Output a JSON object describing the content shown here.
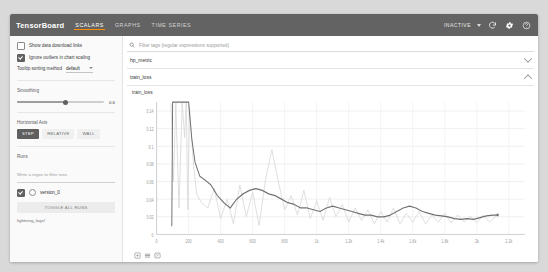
{
  "topbar": {
    "brand": "TensorBoard",
    "tabs": [
      {
        "label": "SCALARS",
        "active": true
      },
      {
        "label": "GRAPHS",
        "active": false
      },
      {
        "label": "TIME SERIES",
        "active": false
      }
    ],
    "status": "INACTIVE",
    "icons": [
      "refresh-icon",
      "settings-icon",
      "help-icon"
    ],
    "bg_color": "#636363",
    "active_tab_underline": "#ff8f00"
  },
  "sidebar": {
    "show_download_links": {
      "label": "Show data download links",
      "checked": false
    },
    "ignore_outliers": {
      "label": "Ignore outliers in chart scaling",
      "checked": true
    },
    "tooltip_sorting": {
      "label": "Tooltip sorting method",
      "value": "default"
    },
    "smoothing": {
      "label": "Smoothing",
      "value": "0.6"
    },
    "horizontal_axis": {
      "label": "Horizontal Axis",
      "options": [
        {
          "label": "STEP",
          "active": true
        },
        {
          "label": "RELATIVE",
          "active": false
        },
        {
          "label": "WALL",
          "active": false
        }
      ]
    },
    "runs": {
      "label": "Runs",
      "filter_placeholder": "Write a regex to filter runs",
      "items": [
        {
          "label": "version_0",
          "checked": true
        }
      ],
      "toggle_all": "TOGGLE ALL RUNS",
      "log_dir": "lightning_logs/"
    }
  },
  "main": {
    "search_placeholder": "Filter tags (regular expressions supported)",
    "sections": [
      {
        "title": "hp_metric",
        "expanded": false
      },
      {
        "title": "train_loss",
        "expanded": true
      }
    ],
    "chart_buttons": [
      "expand-icon",
      "pan-icon",
      "reset-icon"
    ]
  },
  "chart_data": {
    "type": "line",
    "title": "train_loss",
    "xlabel": "",
    "ylabel": "",
    "xlim": [
      0,
      2300
    ],
    "ylim": [
      0,
      0.15
    ],
    "grid": true,
    "legend": null,
    "xticks": [
      0,
      200,
      400,
      600,
      800,
      1000,
      1200,
      1400,
      1600,
      1800,
      2000,
      2200
    ],
    "xticklabels": [
      "0",
      "200",
      "400",
      "600",
      "800",
      "1k",
      "1.2k",
      "1.4k",
      "1.6k",
      "1.8k",
      "2k",
      "2.2k"
    ],
    "yticks": [
      0,
      0.02,
      0.04,
      0.06,
      0.08,
      0.1,
      0.12,
      0.14
    ],
    "yticklabels": [
      "0",
      "0.02",
      "0.04",
      "0.06",
      "0.08",
      "0.1",
      "0.12",
      "0.14"
    ],
    "series": [
      {
        "name": "version_0 (raw)",
        "color": "#d8d8d8",
        "x": [
          90,
          105,
          120,
          140,
          160,
          175,
          185,
          195,
          205,
          215,
          230,
          250,
          280,
          320,
          360,
          400,
          440,
          480,
          520,
          560,
          600,
          640,
          680,
          720,
          760,
          800,
          840,
          880,
          920,
          960,
          1000,
          1040,
          1080,
          1120,
          1160,
          1200,
          1240,
          1280,
          1320,
          1360,
          1400,
          1440,
          1480,
          1520,
          1560,
          1600,
          1640,
          1680,
          1720,
          1760,
          1800,
          1840,
          1880,
          1920,
          1960,
          2000,
          2040,
          2080,
          2120
        ],
        "y": [
          0.148,
          0.06,
          0.149,
          0.03,
          0.15,
          0.11,
          0.15,
          0.028,
          0.145,
          0.12,
          0.08,
          0.046,
          0.036,
          0.03,
          0.052,
          0.018,
          0.04,
          0.012,
          0.056,
          0.02,
          0.048,
          0.01,
          0.062,
          0.096,
          0.06,
          0.028,
          0.044,
          0.022,
          0.05,
          0.018,
          0.038,
          0.016,
          0.042,
          0.02,
          0.034,
          0.014,
          0.03,
          0.016,
          0.028,
          0.012,
          0.026,
          0.014,
          0.03,
          0.012,
          0.024,
          0.014,
          0.026,
          0.012,
          0.022,
          0.014,
          0.024,
          0.013,
          0.022,
          0.014,
          0.021,
          0.013,
          0.022,
          0.014,
          0.021
        ]
      },
      {
        "name": "version_0 (smoothed)",
        "color": "#707070",
        "x": [
          95,
          100,
          110,
          120,
          130,
          145,
          160,
          180,
          200,
          220,
          240,
          270,
          300,
          340,
          380,
          420,
          460,
          500,
          540,
          580,
          620,
          660,
          700,
          740,
          780,
          820,
          860,
          900,
          940,
          980,
          1020,
          1060,
          1100,
          1140,
          1180,
          1220,
          1260,
          1300,
          1340,
          1380,
          1420,
          1460,
          1500,
          1540,
          1580,
          1620,
          1660,
          1700,
          1740,
          1780,
          1820,
          1860,
          1900,
          1940,
          1980,
          2020,
          2060,
          2100,
          2130
        ],
        "y": [
          0.01,
          0.15,
          0.15,
          0.15,
          0.15,
          0.15,
          0.15,
          0.15,
          0.15,
          0.108,
          0.082,
          0.066,
          0.062,
          0.056,
          0.044,
          0.036,
          0.03,
          0.04,
          0.046,
          0.05,
          0.052,
          0.05,
          0.046,
          0.044,
          0.04,
          0.036,
          0.034,
          0.03,
          0.03,
          0.028,
          0.026,
          0.03,
          0.032,
          0.03,
          0.028,
          0.026,
          0.024,
          0.022,
          0.022,
          0.02,
          0.02,
          0.022,
          0.026,
          0.03,
          0.032,
          0.03,
          0.026,
          0.024,
          0.022,
          0.021,
          0.02,
          0.018,
          0.017,
          0.018,
          0.017,
          0.019,
          0.021,
          0.022,
          0.022
        ]
      }
    ]
  }
}
